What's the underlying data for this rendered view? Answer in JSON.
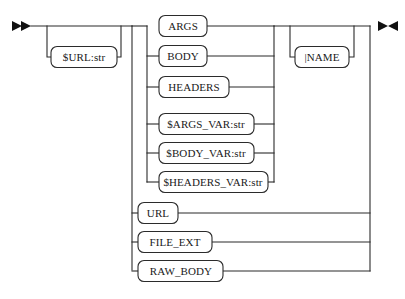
{
  "diagram": {
    "type": "railroad-syntax-diagram",
    "title": "",
    "entry_marker": "double-right-arrow",
    "exit_marker": "bowtie-arrow",
    "line_color": "#2b2b2b",
    "box_fill": "#ffffff",
    "text_color": "#1a1a1a",
    "optional_prefix": {
      "label": "$URL:str",
      "optional": true,
      "x": 84,
      "y": 57,
      "w": 66,
      "h": 21
    },
    "alternatives_group": {
      "optional": false,
      "items": [
        {
          "label": "ARGS",
          "x": 183,
          "y": 26,
          "w": 48,
          "h": 21
        },
        {
          "label": "BODY",
          "x": 183,
          "y": 56,
          "w": 48,
          "h": 21
        },
        {
          "label": "HEADERS",
          "x": 194,
          "y": 87,
          "w": 70,
          "h": 21
        },
        {
          "label": "$ARGS_VAR:str",
          "x": 206,
          "y": 124,
          "w": 95,
          "h": 21
        },
        {
          "label": "$BODY_VAR:str",
          "x": 206,
          "y": 153,
          "w": 95,
          "h": 21
        },
        {
          "label": "$HEADERS_VAR:str",
          "x": 213,
          "y": 182,
          "w": 110,
          "h": 21
        }
      ]
    },
    "tail_alternatives": [
      {
        "label": "URL",
        "x": 158,
        "y": 213,
        "w": 40,
        "h": 21
      },
      {
        "label": "FILE_EXT",
        "x": 176,
        "y": 242,
        "w": 72,
        "h": 21
      },
      {
        "label": "RAW_BODY",
        "x": 181,
        "y": 271,
        "w": 84,
        "h": 21
      }
    ],
    "optional_suffix": {
      "label": "|NAME",
      "optional": true,
      "x": 322,
      "y": 57,
      "w": 54,
      "h": 21
    }
  }
}
